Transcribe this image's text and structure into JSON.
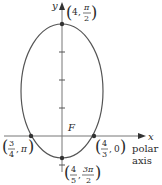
{
  "figure": {
    "axes": {
      "x_label": "x",
      "y_label": "y",
      "polar_axis_label_line1": "polar",
      "polar_axis_label_line2": "axis",
      "focus_label": "F"
    },
    "points": [
      {
        "name": "top-vertex",
        "r_num": "4",
        "theta_num": "π",
        "theta_den": "2"
      },
      {
        "name": "right-intercept",
        "r_num": "4",
        "r_den": "3",
        "theta": "0"
      },
      {
        "name": "left-intercept",
        "r_num": "3",
        "r_den": "4",
        "theta": "π"
      },
      {
        "name": "bottom-vertex",
        "r_num": "4",
        "r_den": "5",
        "theta_num": "3π",
        "theta_den": "2"
      }
    ],
    "colors": {
      "curve": "#555555",
      "axis": "#777777",
      "point": "#333333",
      "text": "#2a2a2a"
    }
  }
}
